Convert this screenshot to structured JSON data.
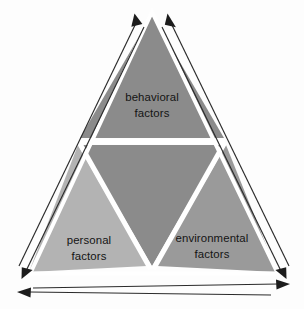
{
  "diagram": {
    "type": "triangle-model",
    "background_color": "#fdfdfd",
    "segments": [
      {
        "id": "behavioral",
        "position": "top",
        "line1": "behavioral",
        "line2": "factors",
        "fill": "#8b8b8b",
        "text_color": "#141414"
      },
      {
        "id": "personal",
        "position": "bottom-left",
        "line1": "personal",
        "line2": "factors",
        "fill": "#b3b3b3",
        "text_color": "#141414"
      },
      {
        "id": "environmental",
        "position": "bottom-right",
        "line1": "environmental",
        "line2": "factors",
        "fill": "#9a9a9a",
        "text_color": "#141414"
      },
      {
        "id": "center",
        "position": "center-inverted",
        "line1": "",
        "line2": "",
        "fill": "#8b8b8b",
        "text_color": "#141414"
      }
    ],
    "separator_color": "#ffffff",
    "arrows": [
      {
        "id": "left-edge-arrow",
        "name": "personal-to-behavioral-arrow",
        "direction": "up",
        "side": "left",
        "color": "#2b2b2b"
      },
      {
        "id": "left-edge-arrow-return",
        "name": "behavioral-to-personal-arrow",
        "direction": "down",
        "side": "left",
        "color": "#2b2b2b"
      },
      {
        "id": "right-edge-arrow",
        "name": "environmental-to-behavioral-arrow",
        "direction": "up",
        "side": "right",
        "color": "#2b2b2b"
      },
      {
        "id": "right-edge-arrow-return",
        "name": "behavioral-to-environmental-arrow",
        "direction": "down",
        "side": "right",
        "color": "#2b2b2b"
      },
      {
        "id": "bottom-arrow",
        "name": "personal-to-environmental-arrow",
        "direction": "right",
        "side": "bottom",
        "color": "#2b2b2b"
      },
      {
        "id": "bottom-arrow-return",
        "name": "environmental-to-personal-arrow",
        "direction": "left",
        "side": "bottom",
        "color": "#2b2b2b"
      }
    ]
  }
}
